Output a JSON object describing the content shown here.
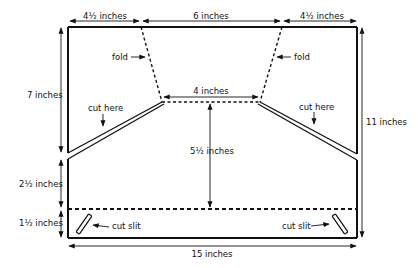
{
  "diagram": {
    "dimensions": {
      "top_left": "4½ inches",
      "top_middle": "6 inches",
      "top_right": "4½ inches",
      "inner_top": "4 inches",
      "left_upper": "7 inches",
      "center_vertical": "5½ inches",
      "left_middle": "2½ inches",
      "left_lower": "1½ inches",
      "right_total": "11 inches",
      "bottom_total": "15 inches"
    },
    "annotations": {
      "fold_left": "fold",
      "fold_right": "fold",
      "cut_here_left": "cut here",
      "cut_here_right": "cut here",
      "cut_slit_left": "cut slit",
      "cut_slit_right": "cut slit"
    },
    "colors": {
      "line": "#111111",
      "background": "#ffffff"
    }
  }
}
